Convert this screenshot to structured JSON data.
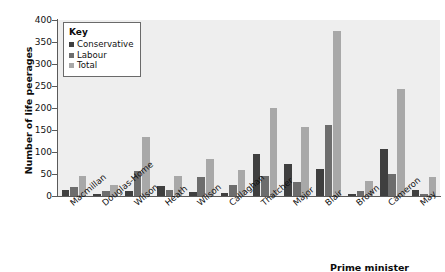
{
  "chart_data": {
    "type": "bar",
    "title": "",
    "xlabel": "Prime minister",
    "ylabel": "Number of life peerages",
    "ylim": [
      0,
      400
    ],
    "yticks": [
      0,
      50,
      100,
      150,
      200,
      250,
      300,
      350,
      400
    ],
    "grid": false,
    "legend_position": "top-left",
    "legend_title": "Key",
    "categories": [
      "Macmillan",
      "Douglas-Home",
      "Wilson",
      "Heath",
      "Wilson",
      "Callaghan",
      "Thatcher",
      "Major",
      "Blair",
      "Brown",
      "Cameron",
      "May"
    ],
    "series": [
      {
        "name": "Conservative",
        "color": "#3f3f3f",
        "values": [
          14,
          5,
          12,
          22,
          9,
          7,
          95,
          72,
          62,
          4,
          106,
          13
        ]
      },
      {
        "name": "Labour",
        "color": "#6d6d6d",
        "values": [
          21,
          12,
          57,
          14,
          44,
          25,
          45,
          32,
          162,
          11,
          51,
          5
        ]
      },
      {
        "name": "Total",
        "color": "#a8a8a8",
        "values": [
          46,
          25,
          135,
          45,
          83,
          58,
          201,
          157,
          374,
          34,
          243,
          43
        ]
      }
    ]
  },
  "axis": {
    "y_title": "Number of life peerages",
    "x_title": "Prime minister"
  }
}
